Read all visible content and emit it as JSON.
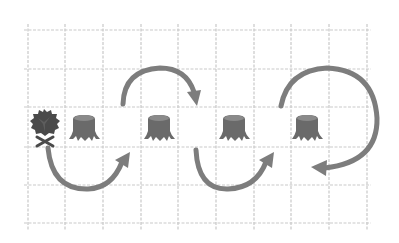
{
  "diagram": {
    "grid": {
      "columns_x": [
        28,
        65,
        103,
        141,
        178,
        216,
        254,
        291,
        329,
        367
      ],
      "rows_y": [
        30,
        69,
        107,
        147,
        185,
        223
      ],
      "line_color": "#c9c9c9"
    },
    "arrow_color": "#7d7d7d",
    "icons": [
      {
        "type": "tree-icon",
        "x": 29,
        "y": 108
      },
      {
        "type": "stump-icon",
        "x": 68,
        "y": 112
      },
      {
        "type": "stump-icon",
        "x": 143,
        "y": 112
      },
      {
        "type": "stump-icon",
        "x": 218,
        "y": 112
      },
      {
        "type": "stump-icon",
        "x": 291,
        "y": 112
      }
    ],
    "arrows": [
      {
        "name": "arrow-hop-1",
        "direction": "below",
        "from": "tree",
        "to": "gap-col-2"
      },
      {
        "name": "arrow-hop-2",
        "direction": "above",
        "from": "gap-col-2",
        "to": "gap-col-4"
      },
      {
        "name": "arrow-hop-3",
        "direction": "below",
        "from": "gap-col-4",
        "to": "gap-col-6"
      },
      {
        "name": "arrow-loop-4",
        "direction": "clockwise-loop",
        "from": "gap-col-6",
        "to": "stump-4"
      }
    ]
  }
}
